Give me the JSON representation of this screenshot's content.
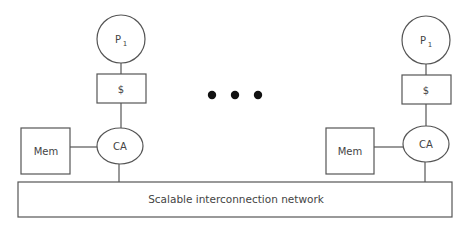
{
  "diagram": {
    "nodes": [
      {
        "id": "left",
        "processor": {
          "label": "P",
          "subscript": "1"
        },
        "cache": {
          "label": "$"
        },
        "comm_assist": {
          "label": "CA"
        },
        "memory": {
          "label": "Mem"
        }
      },
      {
        "id": "right",
        "processor": {
          "label": "P",
          "subscript": "1"
        },
        "cache": {
          "label": "$"
        },
        "comm_assist": {
          "label": "CA"
        },
        "memory": {
          "label": "Mem"
        }
      }
    ],
    "ellipsis": {
      "count": 3,
      "meaning": "more nodes"
    },
    "network": {
      "label": "Scalable interconnection network"
    },
    "colors": {
      "stroke": "#555555",
      "text": "#444444",
      "dots": "#111111",
      "background": "#ffffff"
    }
  }
}
